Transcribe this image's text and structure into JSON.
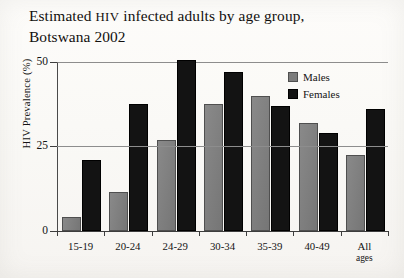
{
  "title": {
    "part1": "Estimated ",
    "smallcaps": "HIV",
    "part2": " infected adults by age group,",
    "line2": "Botswana 2002"
  },
  "axes": {
    "ylabel": "HIV Prevalence (%)",
    "yticks": [
      "0",
      "25",
      "50"
    ],
    "ymin": 0,
    "ymax": 50
  },
  "legend": {
    "items": [
      {
        "label": "Males",
        "color": "#7c7c7c"
      },
      {
        "label": "Females",
        "color": "#131313"
      }
    ]
  },
  "chart_data": {
    "type": "bar",
    "title": "Estimated HIV infected adults by age group, Botswana 2002",
    "xlabel": "",
    "ylabel": "HIV Prevalence (%)",
    "ylim": [
      0,
      50
    ],
    "yticks": [
      0,
      25,
      50
    ],
    "grid": "horizontal-at-25",
    "legend_position": "top-right inside plot",
    "categories": [
      "15-19",
      "20-24",
      "24-29",
      "30-34",
      "35-39",
      "40-49",
      "All ages"
    ],
    "series": [
      {
        "name": "Males",
        "color": "#7c7c7c",
        "values": [
          4,
          11.5,
          27,
          37.5,
          40,
          32,
          22.5
        ]
      },
      {
        "name": "Females",
        "color": "#131313",
        "values": [
          21,
          37.5,
          50.5,
          47,
          37,
          29,
          36
        ]
      }
    ]
  },
  "xcats": [
    {
      "l1": "15-19",
      "l2": ""
    },
    {
      "l1": "20-24",
      "l2": ""
    },
    {
      "l1": "24-29",
      "l2": ""
    },
    {
      "l1": "30-34",
      "l2": ""
    },
    {
      "l1": "35-39",
      "l2": ""
    },
    {
      "l1": "40-49",
      "l2": ""
    },
    {
      "l1": "All",
      "l2": "ages"
    }
  ]
}
